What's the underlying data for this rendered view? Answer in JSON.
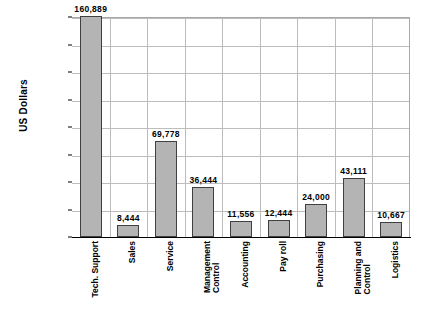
{
  "chart_data": {
    "type": "bar",
    "title": "",
    "xlabel": "",
    "ylabel": "US Dollars",
    "ylim": [
      0,
      160000
    ],
    "ytick_labels": [
      "160,000",
      "140,000",
      "120,000",
      "100,000",
      "80,000",
      "60,000",
      "40,000",
      "20,000",
      "-"
    ],
    "ytick_values": [
      160000,
      140000,
      120000,
      100000,
      80000,
      60000,
      40000,
      20000,
      0
    ],
    "grid": true,
    "legend": "none",
    "categories": [
      "Tech. Support",
      "Sales",
      "Service",
      "Management Control",
      "Accounting",
      "Pay roll",
      "Purchasing",
      "Planning and Control",
      "Logistics"
    ],
    "category_lines": [
      [
        "Tech. Support"
      ],
      [
        "Sales"
      ],
      [
        "Service"
      ],
      [
        "Management",
        "Control"
      ],
      [
        "Accounting"
      ],
      [
        "Pay roll"
      ],
      [
        "Purchasing"
      ],
      [
        "Planning and",
        "Control"
      ],
      [
        "Logistics"
      ]
    ],
    "values": [
      160889,
      8444,
      69778,
      36444,
      11556,
      12444,
      24000,
      43111,
      10667
    ],
    "value_labels": [
      "160,889",
      "8,444",
      "69,778",
      "36,444",
      "11,556",
      "12,444",
      "24,000",
      "43,111",
      "10,667"
    ],
    "colors": {
      "bar_fill": "#b4b4b4",
      "bar_border": "#404040",
      "gridline": "#bdbdbd",
      "axis": "#000000",
      "background": "#ffffff",
      "text": "#000000"
    }
  }
}
